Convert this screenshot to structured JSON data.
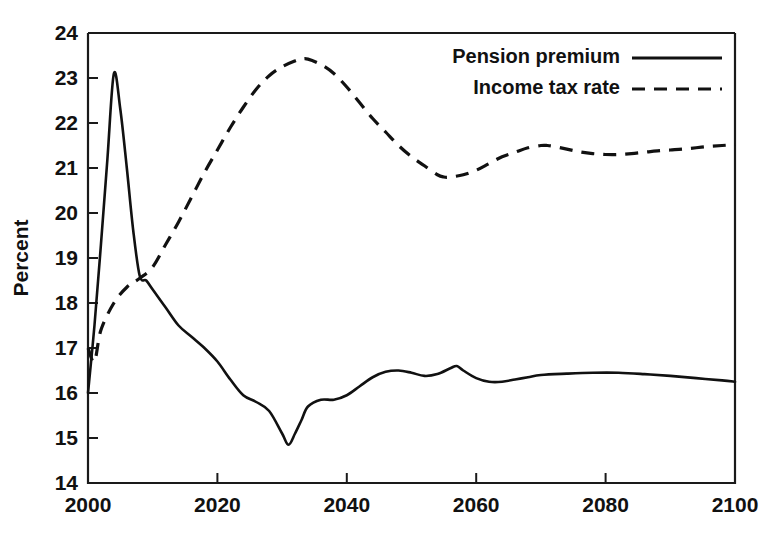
{
  "chart_data": {
    "type": "line",
    "title": "",
    "xlabel": "",
    "ylabel": "Percent",
    "xlim": [
      2000,
      2100
    ],
    "ylim": [
      14,
      24
    ],
    "xticks": [
      2000,
      2020,
      2040,
      2060,
      2080,
      2100
    ],
    "xtick_labels": [
      "2000",
      "2020",
      "2040",
      "2060",
      "2080",
      "2100"
    ],
    "yticks": [
      14,
      15,
      16,
      17,
      18,
      19,
      20,
      21,
      22,
      23,
      24
    ],
    "ytick_labels": [
      "14",
      "15",
      "16",
      "17",
      "18",
      "19",
      "20",
      "21",
      "22",
      "23",
      "24"
    ],
    "grid": false,
    "legend_position": "top-right",
    "line_color": "#111111",
    "series": [
      {
        "name": "Pension premium",
        "style": "solid",
        "x": [
          2000,
          2001,
          2002,
          2003,
          2004,
          2005,
          2006,
          2007,
          2008,
          2009,
          2010,
          2012,
          2014,
          2016,
          2018,
          2020,
          2022,
          2024,
          2026,
          2028,
          2030,
          2031,
          2032,
          2033,
          2034,
          2036,
          2038,
          2040,
          2042,
          2044,
          2046,
          2048,
          2050,
          2052,
          2054,
          2056,
          2057,
          2058,
          2060,
          2062,
          2064,
          2066,
          2068,
          2070,
          2074,
          2078,
          2082,
          2086,
          2090,
          2094,
          2098,
          2100
        ],
        "y": [
          16.0,
          17.5,
          19.3,
          21.2,
          23.1,
          22.3,
          21.0,
          19.6,
          18.6,
          18.5,
          18.3,
          17.9,
          17.5,
          17.25,
          17.0,
          16.7,
          16.3,
          15.95,
          15.8,
          15.6,
          15.1,
          14.85,
          15.1,
          15.4,
          15.7,
          15.85,
          15.85,
          15.95,
          16.15,
          16.35,
          16.47,
          16.5,
          16.45,
          16.38,
          16.42,
          16.55,
          16.6,
          16.5,
          16.33,
          16.25,
          16.25,
          16.3,
          16.35,
          16.4,
          16.43,
          16.45,
          16.45,
          16.42,
          16.38,
          16.33,
          16.28,
          16.25
        ]
      },
      {
        "name": "Income tax rate",
        "style": "dashed",
        "x": [
          2000,
          2001,
          2002,
          2004,
          2006,
          2008,
          2010,
          2012,
          2014,
          2016,
          2018,
          2020,
          2022,
          2024,
          2026,
          2028,
          2030,
          2032,
          2033,
          2034,
          2036,
          2038,
          2040,
          2042,
          2044,
          2046,
          2048,
          2050,
          2052,
          2054,
          2055,
          2056,
          2058,
          2060,
          2062,
          2064,
          2066,
          2068,
          2070,
          2071,
          2072,
          2074,
          2076,
          2078,
          2080,
          2082,
          2084,
          2086,
          2088,
          2090,
          2092,
          2094,
          2096,
          2098,
          2100
        ],
        "y": [
          17.0,
          16.7,
          17.4,
          18.0,
          18.35,
          18.55,
          18.8,
          19.3,
          19.8,
          20.35,
          20.9,
          21.4,
          21.9,
          22.35,
          22.75,
          23.05,
          23.25,
          23.38,
          23.42,
          23.42,
          23.3,
          23.1,
          22.8,
          22.45,
          22.1,
          21.8,
          21.5,
          21.25,
          21.05,
          20.85,
          20.8,
          20.8,
          20.85,
          20.95,
          21.1,
          21.25,
          21.35,
          21.45,
          21.5,
          21.5,
          21.48,
          21.42,
          21.36,
          21.32,
          21.3,
          21.3,
          21.32,
          21.35,
          21.38,
          21.4,
          21.42,
          21.45,
          21.48,
          21.5,
          21.52
        ]
      }
    ]
  },
  "legend": {
    "entries": [
      {
        "label": "Pension premium",
        "style": "solid"
      },
      {
        "label": "Income tax rate",
        "style": "dashed"
      }
    ]
  },
  "axis": {
    "y_title": "Percent"
  }
}
